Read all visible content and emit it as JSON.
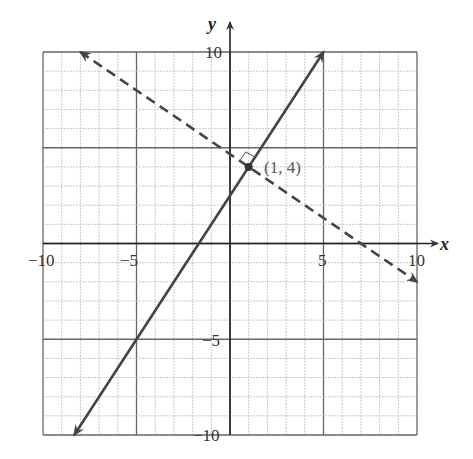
{
  "chart_data": {
    "type": "line",
    "title": "",
    "xlabel": "x",
    "ylabel": "y",
    "xlim": [
      -10,
      10
    ],
    "ylim": [
      -10,
      10
    ],
    "grid": true,
    "x_ticks": [
      -10,
      -5,
      5,
      10
    ],
    "y_ticks": [
      10,
      -5,
      -10
    ],
    "series": [
      {
        "name": "solid line",
        "style": "solid",
        "equation": "y = 1.5x + 2.5",
        "points": [
          [
            -8.33,
            -10
          ],
          [
            5,
            10
          ]
        ],
        "arrows": "both"
      },
      {
        "name": "dashed line",
        "style": "dashed",
        "equation": "y = -2/3 x + 14/3",
        "points": [
          [
            -8,
            10
          ],
          [
            10,
            -2
          ]
        ],
        "arrows": "both"
      }
    ],
    "annotations": [
      {
        "type": "point",
        "x": 1,
        "y": 4,
        "label": "(1, 4)"
      },
      {
        "type": "right-angle-marker",
        "x": 1,
        "y": 4
      }
    ]
  },
  "labels": {
    "x_axis": "x",
    "y_axis": "y",
    "tick_x_neg10": "−10",
    "tick_x_neg5": "−5",
    "tick_x_5": "5",
    "tick_x_10": "10",
    "tick_y_10": "10",
    "tick_y_neg5": "−5",
    "tick_y_neg10": "−10",
    "point": "(1, 4)"
  }
}
